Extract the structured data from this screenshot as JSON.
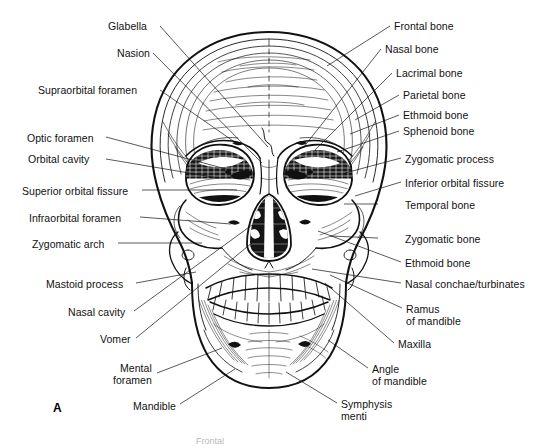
{
  "figure": {
    "panel_letter": "A",
    "caption_partial": "Frontal",
    "background_color": "#ffffff",
    "ink_color": "#111111"
  },
  "labels_left": [
    {
      "text": "Glabella",
      "x": 108,
      "y": 21,
      "lines": 1
    },
    {
      "text": "Nasion",
      "x": 117,
      "y": 48,
      "lines": 1
    },
    {
      "text": "Supraorbital foramen",
      "x": 38,
      "y": 85,
      "lines": 1
    },
    {
      "text": "Optic foramen",
      "x": 27,
      "y": 133,
      "lines": 1
    },
    {
      "text": "Orbital cavity",
      "x": 28,
      "y": 154,
      "lines": 1
    },
    {
      "text": "Superior orbital fissure",
      "x": 22,
      "y": 186,
      "lines": 1
    },
    {
      "text": "Infraorbital foramen",
      "x": 29,
      "y": 213,
      "lines": 1
    },
    {
      "text": "Zygomatic arch",
      "x": 32,
      "y": 239,
      "lines": 1
    },
    {
      "text": "Mastoid process",
      "x": 46,
      "y": 279,
      "lines": 1
    },
    {
      "text": "Nasal cavity",
      "x": 68,
      "y": 307,
      "lines": 1
    },
    {
      "text": "Vomer",
      "x": 100,
      "y": 334,
      "lines": 1
    },
    {
      "text": "Mental\nforamen",
      "x": 113,
      "y": 363,
      "lines": 2
    },
    {
      "text": "Mandible",
      "x": 133,
      "y": 401,
      "lines": 1
    }
  ],
  "labels_right": [
    {
      "text": "Frontal bone",
      "x": 394,
      "y": 21,
      "lines": 1
    },
    {
      "text": "Nasal bone",
      "x": 385,
      "y": 44,
      "lines": 1
    },
    {
      "text": "Lacrimal bone",
      "x": 396,
      "y": 68,
      "lines": 1
    },
    {
      "text": "Parietal bone",
      "x": 403,
      "y": 90,
      "lines": 1
    },
    {
      "text": "Ethmoid bone",
      "x": 403,
      "y": 110,
      "lines": 1
    },
    {
      "text": "Sphenoid bone",
      "x": 403,
      "y": 126,
      "lines": 1
    },
    {
      "text": "Zygomatic process",
      "x": 405,
      "y": 154,
      "lines": 1
    },
    {
      "text": "Inferior orbital fissure",
      "x": 405,
      "y": 178,
      "lines": 1
    },
    {
      "text": "Temporal bone",
      "x": 405,
      "y": 200,
      "lines": 1
    },
    {
      "text": "Zygomatic bone",
      "x": 405,
      "y": 234,
      "lines": 1
    },
    {
      "text": "Ethmoid bone",
      "x": 405,
      "y": 258,
      "lines": 1
    },
    {
      "text": "Nasal conchae/turbinates",
      "x": 405,
      "y": 279,
      "lines": 1
    },
    {
      "text": "Ramus\nof mandible",
      "x": 406,
      "y": 304,
      "lines": 2
    },
    {
      "text": "Maxilla",
      "x": 398,
      "y": 339,
      "lines": 1
    },
    {
      "text": "Angle\nof mandible",
      "x": 372,
      "y": 364,
      "lines": 2
    },
    {
      "text": "Symphysis\nmenti",
      "x": 341,
      "y": 399,
      "lines": 2
    }
  ],
  "leader_lines": [
    {
      "name": "leader-glabella",
      "x1": 160,
      "y1": 26,
      "x2": 268,
      "y2": 147
    },
    {
      "name": "leader-nasion",
      "x1": 153,
      "y1": 53,
      "x2": 262,
      "y2": 163
    },
    {
      "name": "leader-supraorbital-foramen",
      "x1": 160,
      "y1": 90,
      "x2": 236,
      "y2": 143
    },
    {
      "name": "leader-optic-foramen",
      "x1": 106,
      "y1": 137,
      "x2": 230,
      "y2": 170
    },
    {
      "name": "leader-orbital-cavity",
      "x1": 106,
      "y1": 159,
      "x2": 219,
      "y2": 178
    },
    {
      "name": "leader-superior-orbital-fissure",
      "x1": 142,
      "y1": 190,
      "x2": 237,
      "y2": 190
    },
    {
      "name": "leader-infraorbital-foramen",
      "x1": 140,
      "y1": 217,
      "x2": 231,
      "y2": 224
    },
    {
      "name": "leader-zygomatic-arch",
      "x1": 118,
      "y1": 243,
      "x2": 202,
      "y2": 243
    },
    {
      "name": "leader-mastoid-process",
      "x1": 136,
      "y1": 283,
      "x2": 196,
      "y2": 272
    },
    {
      "name": "leader-nasal-cavity",
      "x1": 134,
      "y1": 311,
      "x2": 252,
      "y2": 225
    },
    {
      "name": "leader-vomer",
      "x1": 136,
      "y1": 338,
      "x2": 258,
      "y2": 238
    },
    {
      "name": "leader-mental-foramen",
      "x1": 157,
      "y1": 373,
      "x2": 222,
      "y2": 348
    },
    {
      "name": "leader-mandible",
      "x1": 180,
      "y1": 404,
      "x2": 235,
      "y2": 369
    },
    {
      "name": "leader-frontal-bone",
      "x1": 390,
      "y1": 26,
      "x2": 327,
      "y2": 66
    },
    {
      "name": "leader-nasal-bone",
      "x1": 381,
      "y1": 49,
      "x2": 303,
      "y2": 148
    },
    {
      "name": "leader-lacrimal-bone",
      "x1": 392,
      "y1": 73,
      "x2": 315,
      "y2": 150
    },
    {
      "name": "leader-parietal-bone",
      "x1": 399,
      "y1": 95,
      "x2": 355,
      "y2": 120
    },
    {
      "name": "leader-ethmoid-bone-upper",
      "x1": 399,
      "y1": 115,
      "x2": 350,
      "y2": 134
    },
    {
      "name": "leader-sphenoid-bone",
      "x1": 399,
      "y1": 131,
      "x2": 337,
      "y2": 152
    },
    {
      "name": "leader-zygomatic-process",
      "x1": 401,
      "y1": 158,
      "x2": 345,
      "y2": 173
    },
    {
      "name": "leader-inferior-orbital-fissure",
      "x1": 401,
      "y1": 182,
      "x2": 355,
      "y2": 196
    },
    {
      "name": "leader-temporal-bone",
      "x1": 378,
      "y1": 204,
      "x2": 344,
      "y2": 204
    },
    {
      "name": "leader-zygomatic-bone",
      "x1": 378,
      "y1": 238,
      "x2": 330,
      "y2": 236
    },
    {
      "name": "leader-ethmoid-bone-lower",
      "x1": 401,
      "y1": 262,
      "x2": 318,
      "y2": 231
    },
    {
      "name": "leader-nasal-conchae",
      "x1": 401,
      "y1": 283,
      "x2": 312,
      "y2": 269
    },
    {
      "name": "leader-ramus-of-mandible",
      "x1": 402,
      "y1": 308,
      "x2": 330,
      "y2": 275
    },
    {
      "name": "leader-maxilla",
      "x1": 394,
      "y1": 343,
      "x2": 325,
      "y2": 283
    },
    {
      "name": "leader-angle-of-mandible",
      "x1": 368,
      "y1": 368,
      "x2": 328,
      "y2": 340
    },
    {
      "name": "leader-symphysis-menti",
      "x1": 337,
      "y1": 403,
      "x2": 286,
      "y2": 372
    }
  ]
}
